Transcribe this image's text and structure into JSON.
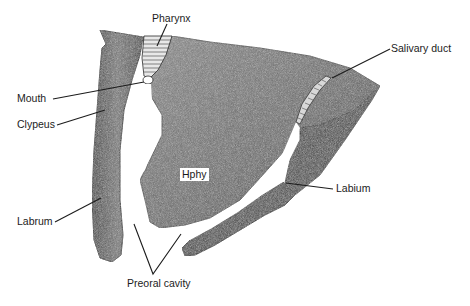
{
  "figure": {
    "colors": {
      "tissue_dark": "#3a3a3a",
      "tissue_mid": "#6e6e6e",
      "tissue_light": "#9a9a9a",
      "line": "#1c1c1c",
      "background": "#ffffff"
    }
  },
  "labels": {
    "pharynx": "Pharynx",
    "salivary_duct": "Salivary duct",
    "mouth": "Mouth",
    "clypeus": "Clypeus",
    "hphy": "Hphy",
    "labium": "Labium",
    "labrum": "Labrum",
    "preoral_cavity": "Preoral cavity"
  }
}
